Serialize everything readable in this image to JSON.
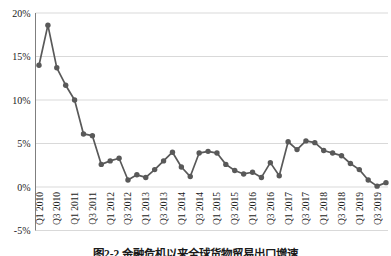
{
  "figure": {
    "caption": "图2-2 金融危机以来全球货物贸易出口增速"
  },
  "chart_data": {
    "type": "line",
    "title": "",
    "xlabel": "",
    "ylabel": "",
    "ylim": [
      -5,
      20
    ],
    "grid": true,
    "legend_position": "none",
    "line_color": "#595959",
    "marker_color": "#595959",
    "gridline_color": "#d9d9d9",
    "axis_color": "#7f7f7f",
    "x_label_every": 2,
    "y_ticks": [
      {
        "value": 20,
        "label": "20%"
      },
      {
        "value": 15,
        "label": "15%"
      },
      {
        "value": 10,
        "label": "10%"
      },
      {
        "value": 5,
        "label": "5%"
      },
      {
        "value": 0,
        "label": "0%"
      },
      {
        "value": -5,
        "label": "-5%"
      }
    ],
    "categories": [
      "Q1 2010",
      "Q2 2010",
      "Q3 2010",
      "Q4 2010",
      "Q1 2011",
      "Q2 2011",
      "Q3 2011",
      "Q4 2011",
      "Q1 2012",
      "Q2 2012",
      "Q3 2012",
      "Q4 2012",
      "Q1 2013",
      "Q2 2013",
      "Q3 2013",
      "Q4 2013",
      "Q1 2014",
      "Q2 2014",
      "Q3 2014",
      "Q4 2014",
      "Q1 2015",
      "Q2 2015",
      "Q3 2015",
      "Q4 2015",
      "Q1 2016",
      "Q2 2016",
      "Q3 2016",
      "Q4 2016",
      "Q1 2017",
      "Q2 2017",
      "Q3 2017",
      "Q4 2017",
      "Q1 2018",
      "Q2 2018",
      "Q3 2018",
      "Q4 2018",
      "Q1 2019",
      "Q2 2019",
      "Q3 2019",
      "Q4 2019"
    ],
    "values": [
      14.0,
      18.6,
      13.7,
      11.7,
      10.0,
      6.1,
      5.9,
      2.6,
      3.0,
      3.3,
      0.8,
      1.4,
      1.1,
      2.0,
      3.0,
      4.0,
      2.3,
      1.2,
      3.9,
      4.1,
      3.9,
      2.6,
      1.9,
      1.5,
      1.7,
      1.1,
      2.8,
      1.3,
      5.2,
      4.3,
      5.3,
      5.1,
      4.2,
      3.9,
      3.6,
      2.7,
      2.0,
      0.8,
      0.1,
      0.5
    ]
  }
}
